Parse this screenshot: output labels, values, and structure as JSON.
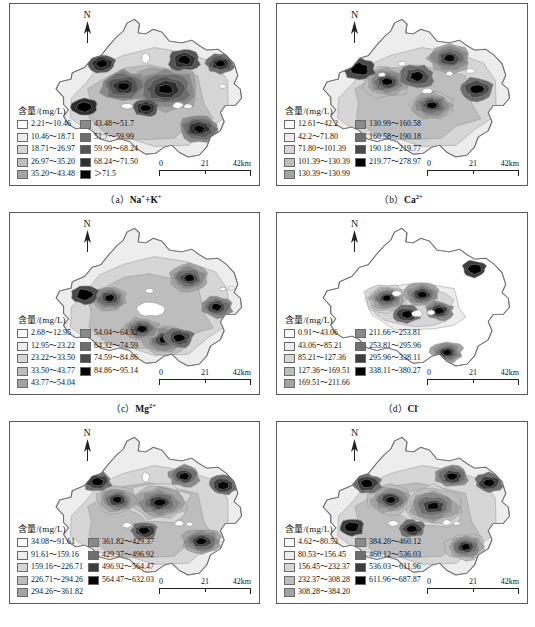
{
  "figure": {
    "scalebar": {
      "min": "0",
      "mid": "21",
      "max": "42km"
    },
    "north_label": "N",
    "legend_title": "含量/(mg/L)"
  },
  "panels": [
    {
      "id": "panel-a",
      "caption_index": "（a）",
      "caption_ion": "Na",
      "caption_sup": "+",
      "caption_extra": "+K",
      "caption_extra_sup": "+",
      "caption_full": "（a）Na⁺+K⁺",
      "legend_title": "含量/(mg/L)",
      "classes": [
        {
          "label": "2.21～10.46",
          "color": "#ffffff"
        },
        {
          "label": "10.46～18.71",
          "color": "#ededed"
        },
        {
          "label": "18.71～26.97",
          "color": "#d6d6d6"
        },
        {
          "label": "26.97～35.20",
          "color": "#bdbdbd"
        },
        {
          "label": "35.20～43.48",
          "color": "#a3a3a3"
        },
        {
          "label": "43.48～51.7",
          "color": "#8a8a8a"
        },
        {
          "label": "51.7～59.99",
          "color": "#6e6e6e"
        },
        {
          "label": "59.99～68.24",
          "color": "#545454"
        },
        {
          "label": "68.24～71.50",
          "color": "#2e2e2e"
        },
        {
          "label": "＞71.5",
          "color": "#000000"
        }
      ]
    },
    {
      "id": "panel-b",
      "caption_index": "（b）",
      "caption_ion": "Ca",
      "caption_sup": "2+",
      "caption_extra": "",
      "caption_extra_sup": "",
      "caption_full": "（b）Ca²⁺",
      "legend_title": "含量/(mg/L)",
      "classes": [
        {
          "label": "12.61～42.2",
          "color": "#ffffff"
        },
        {
          "label": "42.2～71.80",
          "color": "#ededed"
        },
        {
          "label": "71.80～101.39",
          "color": "#d6d6d6"
        },
        {
          "label": "101.39～130.39",
          "color": "#bdbdbd"
        },
        {
          "label": "130.39～130.99",
          "color": "#a3a3a3"
        },
        {
          "label": "130.99～160.58",
          "color": "#8a8a8a"
        },
        {
          "label": "160.58～190.18",
          "color": "#6e6e6e"
        },
        {
          "label": "190.18～219.77",
          "color": "#4a4a4a"
        },
        {
          "label": "219.77～278.97",
          "color": "#000000"
        }
      ]
    },
    {
      "id": "panel-c",
      "caption_index": "（c）",
      "caption_ion": "Mg",
      "caption_sup": "2+",
      "caption_extra": "",
      "caption_extra_sup": "",
      "caption_full": "（c）Mg²⁺",
      "legend_title": "含量/(mg/L)",
      "classes": [
        {
          "label": "2.68～12.95",
          "color": "#ffffff"
        },
        {
          "label": "12.95～23.22",
          "color": "#ededed"
        },
        {
          "label": "23.22～33.50",
          "color": "#d6d6d6"
        },
        {
          "label": "33.50～43.77",
          "color": "#bdbdbd"
        },
        {
          "label": "43.77～54.04",
          "color": "#a3a3a3"
        },
        {
          "label": "54.04～64.32",
          "color": "#8a8a8a"
        },
        {
          "label": "64.32～74.59",
          "color": "#6e6e6e"
        },
        {
          "label": "74.59～84.86",
          "color": "#4a4a4a"
        },
        {
          "label": "84.86～95.14",
          "color": "#000000"
        }
      ]
    },
    {
      "id": "panel-d",
      "caption_index": "（d）",
      "caption_ion": "Cl",
      "caption_sup": "-",
      "caption_extra": "",
      "caption_extra_sup": "",
      "caption_full": "（d）Cl⁻",
      "legend_title": "含量/(mg/L)",
      "classes": [
        {
          "label": "0.91～43.06",
          "color": "#ffffff"
        },
        {
          "label": "43.06～85.21",
          "color": "#ededed"
        },
        {
          "label": "85.21～127.36",
          "color": "#d6d6d6"
        },
        {
          "label": "127.36～169.51",
          "color": "#bdbdbd"
        },
        {
          "label": "169.51～211.66",
          "color": "#a3a3a3"
        },
        {
          "label": "211.66～253.81",
          "color": "#8a8a8a"
        },
        {
          "label": "253.81～295.96",
          "color": "#6e6e6e"
        },
        {
          "label": "295.96～338.11",
          "color": "#3d3d3d"
        },
        {
          "label": "338.11～380.27",
          "color": "#000000"
        }
      ]
    },
    {
      "id": "panel-e",
      "caption_index": "（e）",
      "caption_ion": "",
      "caption_sup": "",
      "caption_extra": "",
      "caption_extra_sup": "",
      "caption_full": "",
      "legend_title": "含量/(mg/L)",
      "classes": [
        {
          "label": "34.08～91.61",
          "color": "#ffffff"
        },
        {
          "label": "91.61～159.16",
          "color": "#ededed"
        },
        {
          "label": "159.16～226.71",
          "color": "#d6d6d6"
        },
        {
          "label": "226.71～294.26",
          "color": "#bdbdbd"
        },
        {
          "label": "294.26～361.82",
          "color": "#a3a3a3"
        },
        {
          "label": "361.82～429.37",
          "color": "#8a8a8a"
        },
        {
          "label": "429.37～496.92",
          "color": "#6e6e6e"
        },
        {
          "label": "496.92～564.47",
          "color": "#3d3d3d"
        },
        {
          "label": "564.47～632.03",
          "color": "#000000"
        }
      ]
    },
    {
      "id": "panel-f",
      "caption_index": "（f）",
      "caption_ion": "",
      "caption_sup": "",
      "caption_extra": "",
      "caption_extra_sup": "",
      "caption_full": "",
      "legend_title": "含量/(mg/L)",
      "classes": [
        {
          "label": "4.62～80.53",
          "color": "#ffffff"
        },
        {
          "label": "80.53～156.45",
          "color": "#ededed"
        },
        {
          "label": "156.45～232.37",
          "color": "#d6d6d6"
        },
        {
          "label": "232.37～308.28",
          "color": "#bdbdbd"
        },
        {
          "label": "308.28～384.20",
          "color": "#a3a3a3"
        },
        {
          "label": "384.20～460.12",
          "color": "#8a8a8a"
        },
        {
          "label": "460.12～536.03",
          "color": "#6e6e6e"
        },
        {
          "label": "536.03～611.96",
          "color": "#3d3d3d"
        },
        {
          "label": "611.96～687.87",
          "color": "#000000"
        }
      ]
    }
  ]
}
